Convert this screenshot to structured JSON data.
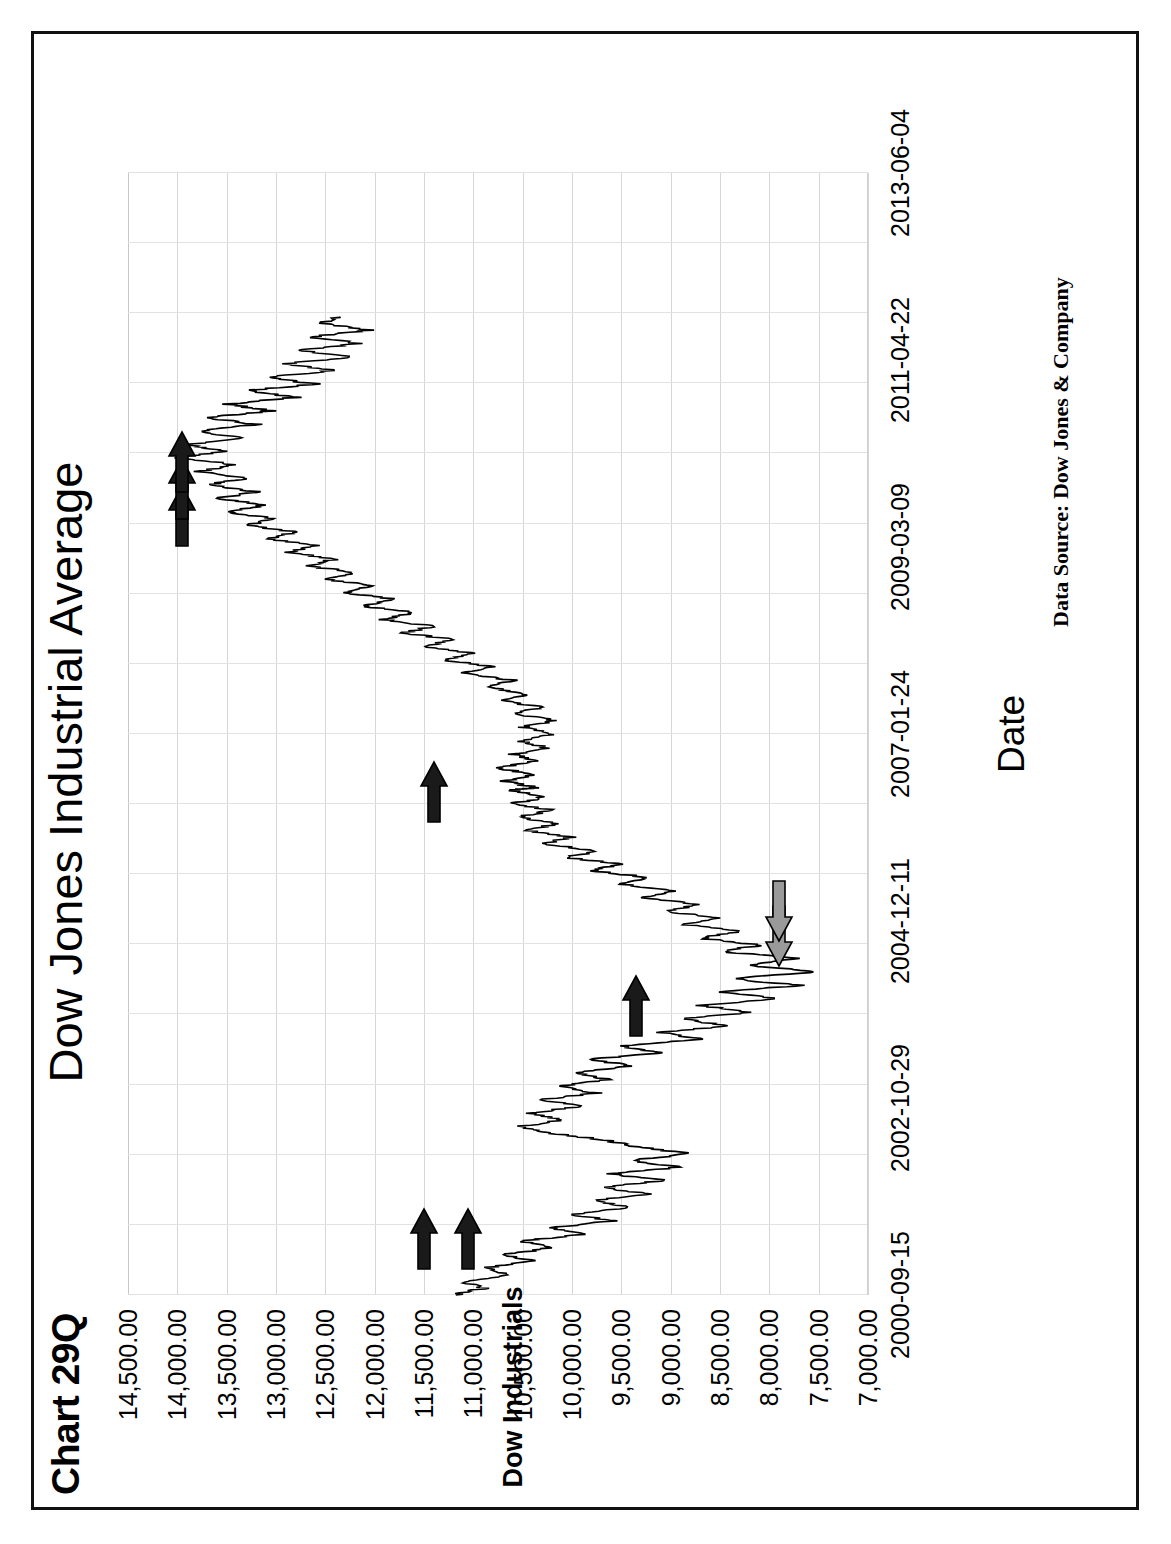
{
  "figure": {
    "label": "Chart 29Q",
    "source_note": "Data Source:  Dow Jones & Company",
    "border_color": "#111111",
    "background": "#ffffff"
  },
  "chart_data": {
    "type": "line",
    "title": "Dow Jones Industrial Average",
    "xlabel": "Date",
    "ylabel": "Dow Industrials",
    "ylim": [
      7000,
      14500
    ],
    "ytick_step": 500,
    "grid": true,
    "legend": "none",
    "line_color": "#000000",
    "ytick_labels": [
      "14,500.00",
      "14,000.00",
      "13,500.00",
      "13,000.00",
      "12,500.00",
      "12,000.00",
      "11,500.00",
      "11,000.00",
      "10,500.00",
      "10,000.00",
      "9,500.00",
      "9,000.00",
      "8,500.00",
      "8,000.00",
      "7,500.00",
      "7,000.00"
    ],
    "ytick_values": [
      14500,
      14000,
      13500,
      13000,
      12500,
      12000,
      11500,
      11000,
      10500,
      10000,
      9500,
      9000,
      8500,
      8000,
      7500,
      7000
    ],
    "xtick_labels": [
      "2000-09-15",
      "2002-10-29",
      "2004-12-11",
      "2007-01-24",
      "2009-03-09",
      "2011-04-22",
      "2013-06-04"
    ],
    "xtick_positions_pct": [
      0,
      16.667,
      33.333,
      50.0,
      66.667,
      83.333,
      100.0
    ],
    "series": [
      {
        "name": "Dow Industrials",
        "x_start": "2000-09-15",
        "x_end": "2008-06",
        "points": [
          [
            0.0,
            11200
          ],
          [
            0.6,
            10900
          ],
          [
            1.2,
            11100
          ],
          [
            1.8,
            10600
          ],
          [
            2.4,
            10900
          ],
          [
            3.0,
            10400
          ],
          [
            3.6,
            10700
          ],
          [
            4.2,
            10200
          ],
          [
            4.8,
            10500
          ],
          [
            5.4,
            9900
          ],
          [
            6.0,
            10200
          ],
          [
            6.6,
            9600
          ],
          [
            7.2,
            10000
          ],
          [
            7.8,
            9400
          ],
          [
            8.4,
            9800
          ],
          [
            9.0,
            9250
          ],
          [
            9.6,
            9700
          ],
          [
            10.2,
            9050
          ],
          [
            10.8,
            9600
          ],
          [
            11.4,
            8900
          ],
          [
            12.0,
            9400
          ],
          [
            12.6,
            8800
          ],
          [
            13.2,
            9350
          ],
          [
            13.8,
            9650
          ],
          [
            14.4,
            10200
          ],
          [
            15.0,
            10550
          ],
          [
            15.6,
            10100
          ],
          [
            16.2,
            10450
          ],
          [
            16.8,
            9900
          ],
          [
            17.4,
            10300
          ],
          [
            18.0,
            9750
          ],
          [
            18.6,
            10150
          ],
          [
            19.2,
            9600
          ],
          [
            19.8,
            10000
          ],
          [
            20.4,
            9400
          ],
          [
            21.0,
            9800
          ],
          [
            21.6,
            9100
          ],
          [
            22.2,
            9500
          ],
          [
            22.8,
            8700
          ],
          [
            23.4,
            9100
          ],
          [
            24.0,
            8400
          ],
          [
            24.6,
            8900
          ],
          [
            25.2,
            8200
          ],
          [
            25.8,
            8700
          ],
          [
            26.4,
            7900
          ],
          [
            27.0,
            8500
          ],
          [
            27.6,
            7700
          ],
          [
            28.2,
            8400
          ],
          [
            28.8,
            7550
          ],
          [
            29.4,
            8200
          ],
          [
            30.0,
            7750
          ],
          [
            30.6,
            8450
          ],
          [
            31.2,
            8100
          ],
          [
            31.8,
            8700
          ],
          [
            32.4,
            8300
          ],
          [
            33.0,
            8850
          ],
          [
            33.6,
            8500
          ],
          [
            34.2,
            9050
          ],
          [
            34.8,
            8700
          ],
          [
            35.4,
            9300
          ],
          [
            36.0,
            8950
          ],
          [
            36.6,
            9500
          ],
          [
            37.2,
            9200
          ],
          [
            37.8,
            9800
          ],
          [
            38.4,
            9500
          ],
          [
            39.0,
            10050
          ],
          [
            39.6,
            9750
          ],
          [
            40.2,
            10300
          ],
          [
            40.8,
            10000
          ],
          [
            41.4,
            10450
          ],
          [
            42.0,
            10150
          ],
          [
            42.6,
            10550
          ],
          [
            43.2,
            10200
          ],
          [
            43.8,
            10600
          ],
          [
            44.4,
            10250
          ],
          [
            45.0,
            10650
          ],
          [
            45.2,
            10350
          ],
          [
            45.8,
            10700
          ],
          [
            46.4,
            10400
          ],
          [
            47.0,
            10750
          ],
          [
            47.6,
            10350
          ],
          [
            48.2,
            10600
          ],
          [
            48.8,
            10250
          ],
          [
            49.4,
            10550
          ],
          [
            50.0,
            10200
          ],
          [
            50.6,
            10500
          ],
          [
            51.2,
            10150
          ],
          [
            51.8,
            10600
          ],
          [
            52.4,
            10300
          ],
          [
            53.0,
            10750
          ],
          [
            53.6,
            10450
          ],
          [
            54.2,
            10900
          ],
          [
            54.8,
            10600
          ],
          [
            55.4,
            11100
          ],
          [
            56.0,
            10800
          ],
          [
            56.6,
            11300
          ],
          [
            57.2,
            11000
          ],
          [
            57.8,
            11500
          ],
          [
            58.4,
            11200
          ],
          [
            59.0,
            11700
          ],
          [
            59.6,
            11400
          ],
          [
            60.2,
            11900
          ],
          [
            60.8,
            11600
          ],
          [
            61.4,
            12100
          ],
          [
            62.0,
            11800
          ],
          [
            62.6,
            12300
          ],
          [
            63.2,
            12000
          ],
          [
            63.8,
            12500
          ],
          [
            64.4,
            12200
          ],
          [
            65.0,
            12700
          ],
          [
            65.6,
            12400
          ],
          [
            66.2,
            12900
          ],
          [
            66.8,
            12600
          ],
          [
            67.4,
            13100
          ],
          [
            68.0,
            12800
          ],
          [
            68.6,
            13300
          ],
          [
            69.2,
            13000
          ],
          [
            69.8,
            13500
          ],
          [
            70.4,
            13100
          ],
          [
            71.0,
            13600
          ],
          [
            71.6,
            13200
          ],
          [
            72.2,
            13700
          ],
          [
            72.8,
            13300
          ],
          [
            73.4,
            13800
          ],
          [
            74.0,
            13400
          ],
          [
            74.6,
            14000
          ],
          [
            75.2,
            13500
          ],
          [
            75.8,
            13900
          ],
          [
            76.4,
            13350
          ],
          [
            77.0,
            13800
          ],
          [
            77.6,
            13200
          ],
          [
            78.2,
            13700
          ],
          [
            78.8,
            13050
          ],
          [
            79.4,
            13500
          ],
          [
            80.0,
            12800
          ],
          [
            80.6,
            13300
          ],
          [
            81.2,
            12600
          ],
          [
            81.8,
            13100
          ],
          [
            82.4,
            12400
          ],
          [
            83.0,
            12900
          ],
          [
            83.6,
            12250
          ],
          [
            84.2,
            12750
          ],
          [
            84.8,
            12150
          ],
          [
            85.4,
            12650
          ],
          [
            86.0,
            12050
          ],
          [
            86.6,
            12550
          ],
          [
            87.2,
            12350
          ]
        ]
      }
    ],
    "annotations": [
      {
        "name": "annotation-arrow-black-1",
        "color": "#1a1a1a",
        "direction": "down",
        "x_pct": 5.0,
        "y_value": 11500
      },
      {
        "name": "annotation-arrow-black-2",
        "color": "#1a1a1a",
        "direction": "down",
        "x_pct": 5.0,
        "y_value": 11050
      },
      {
        "name": "annotation-arrow-black-3",
        "color": "#1a1a1a",
        "direction": "down",
        "x_pct": 25.8,
        "y_value": 9350
      },
      {
        "name": "annotation-arrow-gray-1",
        "color": "#9a9a9a",
        "direction": "up",
        "x_pct": 32.0,
        "y_value": 7900
      },
      {
        "name": "annotation-arrow-gray-2",
        "color": "#9a9a9a",
        "direction": "up",
        "x_pct": 34.2,
        "y_value": 7900
      },
      {
        "name": "annotation-arrow-black-4",
        "color": "#1a1a1a",
        "direction": "down",
        "x_pct": 44.8,
        "y_value": 11400
      },
      {
        "name": "annotation-arrow-black-5",
        "color": "#1a1a1a",
        "direction": "down",
        "x_pct": 69.4,
        "y_value": 13950
      },
      {
        "name": "annotation-arrow-black-6",
        "color": "#1a1a1a",
        "direction": "down",
        "x_pct": 71.8,
        "y_value": 13950
      },
      {
        "name": "annotation-arrow-black-7",
        "color": "#1a1a1a",
        "direction": "down",
        "x_pct": 74.2,
        "y_value": 13950
      }
    ]
  }
}
